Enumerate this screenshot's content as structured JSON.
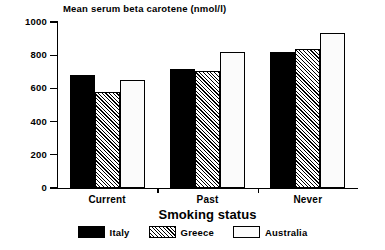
{
  "chart_data": {
    "type": "bar",
    "title": "Mean serum beta carotene (nmol/l)",
    "xlabel": "Smoking status",
    "ylabel": "",
    "categories": [
      "Current",
      "Past",
      "Never"
    ],
    "series": [
      {
        "name": "Italy",
        "values": [
          680,
          717,
          820
        ],
        "fill": "solid-black"
      },
      {
        "name": "Greece",
        "values": [
          578,
          705,
          838
        ],
        "fill": "diagonal-hatch"
      },
      {
        "name": "Australia",
        "values": [
          650,
          820,
          934
        ],
        "fill": "white-empty"
      }
    ],
    "ylim": [
      0,
      1000
    ],
    "yticks": [
      0,
      200,
      400,
      600,
      800,
      1000
    ],
    "ytick_labels": [
      "0",
      "200",
      "400",
      "600",
      "800",
      "1000"
    ],
    "grid": false,
    "legend_position": "bottom",
    "colors": {
      "italy": "#000000",
      "greece": "#ffffff",
      "australia": "#fbfbfb",
      "axis": "#000000",
      "background": "#ffffff"
    }
  },
  "legend": {
    "entries": [
      {
        "label": "Italy"
      },
      {
        "label": "Greece"
      },
      {
        "label": "Australia"
      }
    ]
  }
}
